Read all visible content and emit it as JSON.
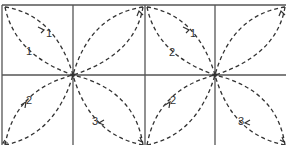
{
  "diagram": {
    "type": "quilt-stitch-path",
    "tiles": [
      {
        "id": "left-tile",
        "center": [
          73,
          75
        ],
        "labels": [
          {
            "text": "1",
            "x": 46,
            "y": 37
          },
          {
            "text": "1",
            "x": 26,
            "y": 55
          },
          {
            "text": "2",
            "x": 26,
            "y": 104
          },
          {
            "text": "3",
            "x": 92,
            "y": 125
          }
        ]
      },
      {
        "id": "right-tile",
        "center": [
          215,
          75
        ],
        "labels": [
          {
            "text": "1",
            "x": 190,
            "y": 37
          },
          {
            "text": "2",
            "x": 169,
            "y": 56
          },
          {
            "text": "2",
            "x": 170,
            "y": 104
          },
          {
            "text": "3",
            "x": 238,
            "y": 125
          }
        ]
      }
    ],
    "colors": {
      "grid": "#555555",
      "stroke": "#333333",
      "background": "#ffffff"
    }
  }
}
